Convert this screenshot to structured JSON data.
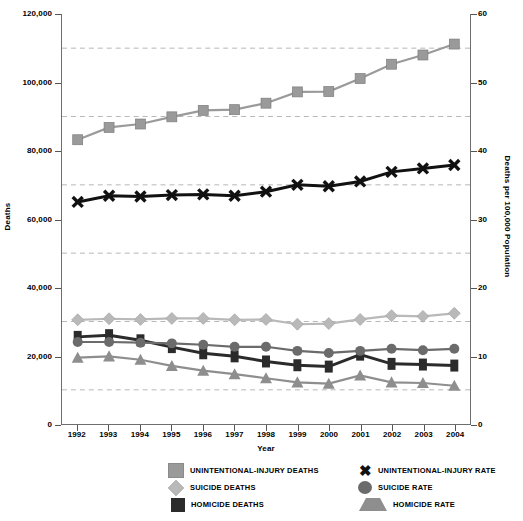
{
  "chart_data": {
    "type": "line",
    "title": "",
    "xlabel": "Year",
    "ylabel": "Deaths",
    "ylabel_right": "Deaths per 100,000 Population",
    "categories": [
      1992,
      1993,
      1994,
      1995,
      1996,
      1997,
      1998,
      1999,
      2000,
      2001,
      2002,
      2003,
      2004
    ],
    "ylim": [
      0,
      120000
    ],
    "ylim_right": [
      0,
      60
    ],
    "yticks": [
      "0",
      "20,000",
      "40,000",
      "60,000",
      "80,000",
      "100,000",
      "120,000"
    ],
    "ytick_values": [
      0,
      20000,
      40000,
      60000,
      80000,
      100000,
      120000
    ],
    "yticks_right": [
      "0",
      "10",
      "20",
      "30",
      "40",
      "50",
      "60"
    ],
    "ytick_values_right": [
      0,
      10,
      20,
      30,
      40,
      50,
      60
    ],
    "gridline_values": [
      10000,
      30000,
      50000,
      70000,
      90000,
      110000
    ],
    "grid": true,
    "legend_position": "bottom",
    "series": [
      {
        "name": "UNINTENTIONAL-INJURY DEATHS",
        "axis": "left",
        "marker": "square",
        "color": "#9a9a9a",
        "values": [
          83200,
          86800,
          87800,
          89900,
          91800,
          92000,
          93900,
          97200,
          97300,
          101100,
          105300,
          108000,
          111200
        ]
      },
      {
        "name": "SUICIDE DEATHS",
        "axis": "left",
        "marker": "diamond",
        "color": "#b9b9b9",
        "values": [
          30500,
          30800,
          30600,
          30900,
          30900,
          30500,
          30600,
          29200,
          29400,
          30600,
          31700,
          31500,
          32400
        ]
      },
      {
        "name": "HOMICIDE DEATHS",
        "axis": "left",
        "marker": "vrect",
        "color": "#2b2b2b",
        "values": [
          25500,
          26000,
          24500,
          22500,
          20700,
          19800,
          18300,
          17200,
          16800,
          20300,
          17600,
          17400,
          17100
        ]
      },
      {
        "name": "UNINTENTIONAL-INJURY RATE",
        "axis": "right",
        "marker": "x",
        "color": "#111111",
        "values": [
          32.5,
          33.4,
          33.3,
          33.5,
          33.6,
          33.4,
          34.0,
          35.0,
          34.8,
          35.5,
          36.9,
          37.4,
          37.9
        ]
      },
      {
        "name": "SUICIDE RATE",
        "axis": "right",
        "marker": "circle",
        "color": "#6b6b6b",
        "values": [
          12.0,
          12.0,
          11.9,
          11.8,
          11.6,
          11.3,
          11.3,
          10.7,
          10.4,
          10.7,
          11.0,
          10.8,
          11.0
        ]
      },
      {
        "name": "HOMICIDE RATE",
        "axis": "right",
        "marker": "triangle",
        "color": "#8e8e8e",
        "values": [
          9.7,
          9.9,
          9.4,
          8.5,
          7.8,
          7.3,
          6.7,
          6.1,
          5.9,
          7.1,
          6.1,
          6.0,
          5.6
        ]
      }
    ]
  },
  "axes": {
    "left_title": "Deaths",
    "right_title": "Deaths per 100,000 Population",
    "x_title": "Year"
  },
  "legend": {
    "left_column": [
      {
        "label": "UNINTENTIONAL-INJURY DEATHS",
        "marker": "square"
      },
      {
        "label": "SUICIDE DEATHS",
        "marker": "diamond"
      },
      {
        "label": "HOMICIDE DEATHS",
        "marker": "vrect"
      }
    ],
    "right_column": [
      {
        "label": "UNINTENTIONAL-INJURY RATE",
        "marker": "x",
        "glyph": "✖"
      },
      {
        "label": "SUICIDE RATE",
        "marker": "circle"
      },
      {
        "label": "HOMICIDE RATE",
        "marker": "triangle"
      }
    ]
  },
  "colors": {
    "unintentional_deaths": "#9a9a9a",
    "suicide_deaths": "#b9b9b9",
    "homicide_deaths": "#2b2b2b",
    "unintentional_rate": "#111111",
    "suicide_rate": "#6b6b6b",
    "homicide_rate": "#8e8e8e",
    "grid": "#b8b8b8",
    "frame": "#6e6e6e"
  }
}
